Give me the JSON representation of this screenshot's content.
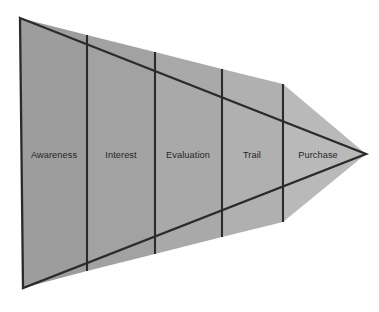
{
  "diagram": {
    "type": "horizontal-funnel-triangle",
    "orientation": "left-to-right, wide to narrow",
    "background_color": "#ffffff",
    "outline_color": "#2b2b2b",
    "label_color": "#262626",
    "geometry": {
      "top_left": [
        20,
        18
      ],
      "bottom_left": [
        23,
        288
      ],
      "right_tip": [
        366,
        154
      ],
      "divider_x": [
        87,
        155,
        222,
        283
      ]
    },
    "stages": [
      {
        "label": "Awareness",
        "index": 1,
        "fill_color": "#9d9d9d",
        "label_x": 54,
        "label_y": 155
      },
      {
        "label": "Interest",
        "index": 2,
        "fill_color": "#a2a2a2",
        "label_x": 121,
        "label_y": 155
      },
      {
        "label": "Evaluation",
        "index": 3,
        "fill_color": "#a9a9a9",
        "label_x": 188,
        "label_y": 155
      },
      {
        "label": "Trail",
        "index": 4,
        "fill_color": "#b0b0b0",
        "label_x": 252,
        "label_y": 155
      },
      {
        "label": "Purchase",
        "index": 5,
        "fill_color": "#b9b9b9",
        "label_x": 318,
        "label_y": 155
      }
    ]
  }
}
